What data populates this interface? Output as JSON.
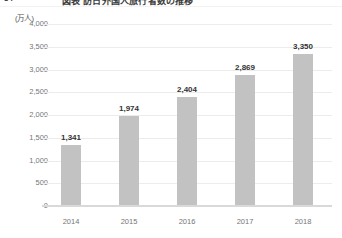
{
  "header": {
    "number": "34",
    "title": "図表 訪日外国人旅行者数の推移",
    "clipped": true
  },
  "chart_data": {
    "type": "bar",
    "title": "",
    "subtitle": "",
    "xlabel": "",
    "ylabel": "",
    "unit_label": "(万人)",
    "categories": [
      "2014",
      "2015",
      "2016",
      "2017",
      "2018"
    ],
    "values": [
      1341,
      1974,
      2404,
      2869,
      3350
    ],
    "value_labels": [
      "1,341",
      "1,974",
      "2,404",
      "2,869",
      "3,350"
    ],
    "ylim": [
      0,
      4000
    ],
    "ytick_step": 500,
    "ytick_labels": [
      "4,000",
      "3,500",
      "3,000",
      "2,500",
      "2,000",
      "1,500",
      "1,000",
      "500",
      "0"
    ],
    "ytick_values": [
      4000,
      3500,
      3000,
      2500,
      2000,
      1500,
      1000,
      500,
      0
    ],
    "grid": true,
    "legend": "none",
    "bar_color": "#c2c2c2",
    "grid_color": "#ececec",
    "axis_color": "#d9d9d9",
    "label_color": "#333333",
    "tick_color": "#767676"
  }
}
